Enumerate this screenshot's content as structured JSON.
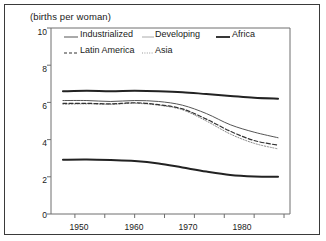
{
  "chart_data": {
    "type": "line",
    "title": "(births per woman)",
    "xlabel": "",
    "ylabel": "(births per woman)",
    "xlim": [
      1946,
      1986
    ],
    "ylim": [
      0,
      10
    ],
    "yticks": [
      0,
      2,
      4,
      6,
      8,
      10
    ],
    "ytick_labels": [
      "0",
      "2",
      "4",
      "6",
      "8",
      "10"
    ],
    "xticks": [
      1950,
      1960,
      1970,
      1980
    ],
    "xtick_labels": [
      "1950",
      "1960",
      "1970",
      "1980"
    ],
    "xminor_ticks": [
      1955,
      1965,
      1975,
      1985
    ],
    "grid": false,
    "legend_position": "top-inside",
    "x": [
      1948,
      1952,
      1956,
      1960,
      1964,
      1968,
      1972,
      1976,
      1980,
      1984
    ],
    "series": [
      {
        "name": "Industrialized",
        "style": "solid-thin",
        "color": "#555555",
        "width": 1.0,
        "values": [
          6.1,
          6.1,
          6.05,
          6.1,
          6.05,
          5.85,
          5.4,
          4.8,
          4.4,
          4.1
        ]
      },
      {
        "name": "Developing",
        "style": "dotted",
        "color": "#8a8a8a",
        "width": 1.0,
        "values": [
          5.9,
          5.92,
          5.9,
          5.95,
          5.85,
          5.6,
          5.0,
          4.3,
          3.8,
          3.5
        ]
      },
      {
        "name": "Africa",
        "style": "solid-thick",
        "color": "#222222",
        "width": 2.0,
        "values": [
          6.6,
          6.62,
          6.6,
          6.62,
          6.6,
          6.55,
          6.45,
          6.35,
          6.25,
          6.2
        ]
      },
      {
        "name": "Latin America",
        "style": "dashed",
        "color": "#333333",
        "width": 1.2,
        "values": [
          5.95,
          5.95,
          5.92,
          5.98,
          5.88,
          5.65,
          5.1,
          4.45,
          3.95,
          3.7
        ]
      },
      {
        "name": "Asia",
        "style": "solid-thick-bottom",
        "color": "#222222",
        "width": 2.0,
        "values": [
          2.92,
          2.93,
          2.9,
          2.85,
          2.72,
          2.5,
          2.28,
          2.1,
          2.02,
          2.0
        ]
      }
    ]
  },
  "axis": {
    "y_labels": [
      "10",
      "8",
      "6",
      "4",
      "2",
      "0"
    ],
    "x_labels": [
      "1950",
      "1960",
      "1970",
      "1980"
    ]
  },
  "legend": {
    "row1": [
      {
        "label": "Industrialized",
        "swatch": "solid-thin-line-icon"
      },
      {
        "label": "Developing",
        "swatch": "solid-light-line-icon"
      },
      {
        "label": "Africa",
        "swatch": "solid-thick-line-icon"
      }
    ],
    "row2": [
      {
        "label": "Latin America",
        "swatch": "dashed-line-icon"
      },
      {
        "label": "Asia",
        "swatch": "dotted-line-icon"
      }
    ]
  }
}
